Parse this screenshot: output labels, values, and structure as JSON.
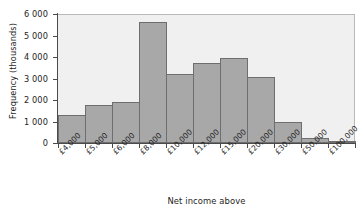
{
  "chart_data": {
    "type": "bar",
    "title": "",
    "subtitle": "",
    "xlabel": "Net income above",
    "ylabel": "Frequency (thousands)",
    "categories": [
      "£4,000",
      "£5,000",
      "£6,000",
      "£8,000",
      "£10,000",
      "£12,000",
      "£15,000",
      "£20,000",
      "£30,000",
      "£50,000",
      "£100,000"
    ],
    "values": [
      1300,
      1780,
      1930,
      5620,
      3200,
      3700,
      3950,
      3050,
      1000,
      250,
      60
    ],
    "ylim": [
      0,
      6000
    ],
    "ytick_values": [
      0,
      1000,
      2000,
      3000,
      4000,
      5000,
      6000
    ],
    "ytick_labels": [
      "0",
      "1 000",
      "2 000",
      "3 000",
      "4 000",
      "5 000",
      "6 000"
    ],
    "grid": false,
    "legend": null,
    "bar_gap": 0,
    "colors": {
      "bar_fill": "#a8a8a8",
      "bar_border": "#6e6e6e",
      "plot_background": "#f0f0f0",
      "axis": "#4a4a4a",
      "text": "#1d1d1d",
      "figure_background": "#ffffff"
    },
    "xtick_label_rotation": -45
  }
}
